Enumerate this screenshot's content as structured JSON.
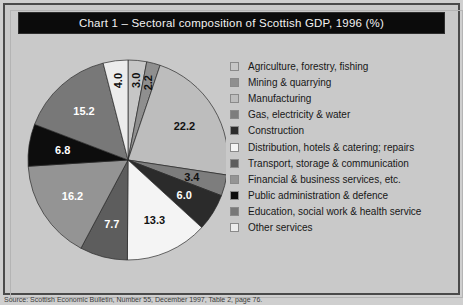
{
  "figure": {
    "title": "Chart 1 – Sectoral composition of Scottish GDP, 1996 (%)",
    "source_note": "Source: Scottish Economic Bulletin, Number 55, December 1997, Table 2, page 76."
  },
  "chart_data": {
    "type": "pie",
    "title": "Chart 1 – Sectoral composition of Scottish GDP, 1996 (%)",
    "xlabel": "",
    "ylabel": "",
    "unit": "%",
    "legend_position": "right",
    "grid": false,
    "start_angle_deg": 0,
    "direction": "clockwise",
    "categories": [
      "Agriculture, forestry, fishing",
      "Mining & quarrying",
      "Manufacturing",
      "Gas, electricity & water",
      "Construction",
      "Distribution, hotels & catering; repairs",
      "Transport, storage & communication",
      "Financial & business services, etc.",
      "Public administration & defence",
      "Education, social work & health service",
      "Other services"
    ],
    "values": [
      3.0,
      2.2,
      22.2,
      3.4,
      6.0,
      13.3,
      7.7,
      16.2,
      6.8,
      15.2,
      4.0
    ],
    "colors": [
      "#c6c6c6",
      "#8f8f8f",
      "#bdbdbd",
      "#7d7d7d",
      "#2b2b2b",
      "#f4f4f4",
      "#5d5d5d",
      "#949494",
      "#0d0d0d",
      "#787878",
      "#ececec"
    ],
    "label_colors": [
      "#111111",
      "#111111",
      "#111111",
      "#111111",
      "#ffffff",
      "#111111",
      "#ffffff",
      "#ffffff",
      "#ffffff",
      "#ffffff",
      "#111111"
    ],
    "slices": [
      {
        "label": "Agriculture, forestry, fishing",
        "value": 3.0,
        "value_text": "3.0",
        "color": "#c6c6c6",
        "label_color": "#111111",
        "rotated": true
      },
      {
        "label": "Mining & quarrying",
        "value": 2.2,
        "value_text": "2.2",
        "color": "#8f8f8f",
        "label_color": "#111111",
        "rotated": true
      },
      {
        "label": "Manufacturing",
        "value": 22.2,
        "value_text": "22.2",
        "color": "#bdbdbd",
        "label_color": "#111111",
        "rotated": false
      },
      {
        "label": "Gas, electricity & water",
        "value": 3.4,
        "value_text": "3.4",
        "color": "#7d7d7d",
        "label_color": "#111111",
        "rotated": false
      },
      {
        "label": "Construction",
        "value": 6.0,
        "value_text": "6.0",
        "color": "#2b2b2b",
        "label_color": "#ffffff",
        "rotated": false
      },
      {
        "label": "Distribution, hotels & catering; repairs",
        "value": 13.3,
        "value_text": "13.3",
        "color": "#f4f4f4",
        "label_color": "#111111",
        "rotated": false
      },
      {
        "label": "Transport, storage & communication",
        "value": 7.7,
        "value_text": "7.7",
        "color": "#5d5d5d",
        "label_color": "#ffffff",
        "rotated": false
      },
      {
        "label": "Financial & business services, etc.",
        "value": 16.2,
        "value_text": "16.2",
        "color": "#949494",
        "label_color": "#ffffff",
        "rotated": false
      },
      {
        "label": "Public administration & defence",
        "value": 6.8,
        "value_text": "6.8",
        "color": "#0d0d0d",
        "label_color": "#ffffff",
        "rotated": false
      },
      {
        "label": "Education, social work & health service",
        "value": 15.2,
        "value_text": "15.2",
        "color": "#787878",
        "label_color": "#ffffff",
        "rotated": false
      },
      {
        "label": "Other services",
        "value": 4.0,
        "value_text": "4.0",
        "color": "#ececec",
        "label_color": "#111111",
        "rotated": true
      }
    ],
    "draw_order": [
      1,
      2,
      3,
      4,
      5,
      6,
      7,
      8,
      9,
      10,
      0
    ]
  },
  "legend": {
    "items": [
      {
        "label": "Agriculture, forestry, fishing",
        "color": "#c6c6c6"
      },
      {
        "label": "Mining & quarrying",
        "color": "#8f8f8f"
      },
      {
        "label": "Manufacturing",
        "color": "#bdbdbd"
      },
      {
        "label": "Gas, electricity & water",
        "color": "#7d7d7d"
      },
      {
        "label": "Construction",
        "color": "#2b2b2b"
      },
      {
        "label": "Distribution, hotels & catering; repairs",
        "color": "#f4f4f4"
      },
      {
        "label": "Transport, storage & communication",
        "color": "#5d5d5d"
      },
      {
        "label": "Financial & business services, etc.",
        "color": "#949494"
      },
      {
        "label": "Public administration & defence",
        "color": "#0d0d0d"
      },
      {
        "label": "Education, social work & health service",
        "color": "#787878"
      },
      {
        "label": "Other services",
        "color": "#ececec"
      }
    ]
  }
}
